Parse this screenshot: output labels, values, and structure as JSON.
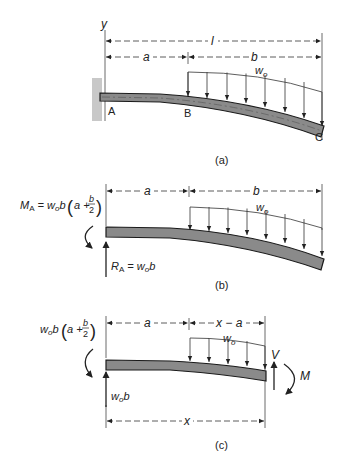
{
  "colors": {
    "ink": "#222222",
    "beam_fill": "#8a8a8a",
    "beam_stroke": "#1a1a1a",
    "wall": "#c8c8c8"
  },
  "panel_a": {
    "caption": "(a)",
    "axis_label": "y",
    "dim_total": "l",
    "dim_a": "a",
    "dim_b": "b",
    "load_label": "w",
    "load_sub": "o",
    "point_a": "A",
    "point_b": "B",
    "point_c": "C"
  },
  "panel_b": {
    "caption": "(b)",
    "dim_a": "a",
    "dim_b": "b",
    "load_label": "w",
    "load_sub": "o",
    "moment": {
      "symbol": "M",
      "sub": "A",
      "eq": " = w",
      "eq_sub": "o",
      "eq_rest": "b",
      "paren_a": "a +",
      "frac_num": "b",
      "frac_den": "2"
    },
    "reaction": {
      "symbol": "R",
      "sub": "A",
      "eq": " = w",
      "eq_sub": "o",
      "eq_rest": "b"
    }
  },
  "panel_c": {
    "caption": "(c)",
    "dim_a": "a",
    "dim_xa": "x − a",
    "dim_x": "x",
    "load_label": "w",
    "load_sub": "o",
    "moment": {
      "w": "w",
      "w_sub": "o",
      "rest": "b",
      "paren_a": "a +",
      "frac_num": "b",
      "frac_den": "2"
    },
    "reaction": {
      "w": "w",
      "w_sub": "o",
      "rest": "b"
    },
    "shear": "V",
    "internal_moment": "M"
  }
}
